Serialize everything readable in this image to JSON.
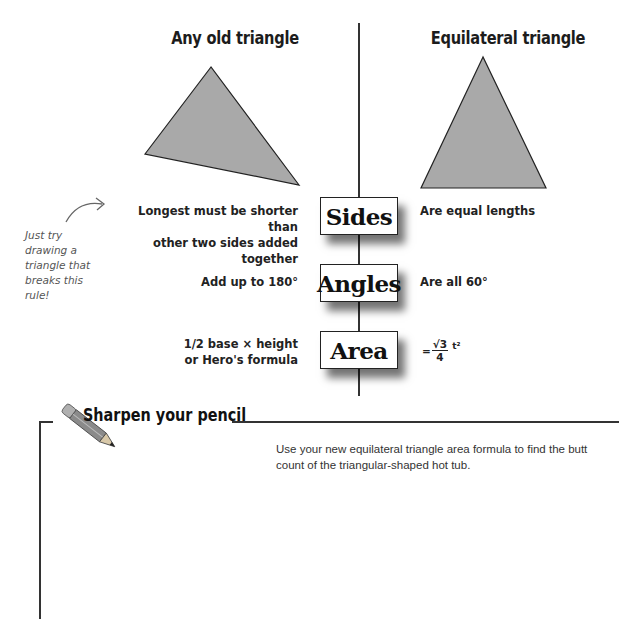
{
  "columns": {
    "left_title": "Any old triangle",
    "right_title": "Equilateral triangle"
  },
  "rows": [
    {
      "label": "Sides",
      "left": [
        "Longest must be shorter than",
        "other two sides added together"
      ],
      "right": "Are equal lengths"
    },
    {
      "label": "Angles",
      "left": [
        "Add up to 180°"
      ],
      "right": "Are all 60°"
    },
    {
      "label": "Area",
      "left": [
        "1/2 base × height",
        "or Hero's formula"
      ],
      "right": {
        "prefix": "=",
        "numerator": "√3",
        "denominator": "4",
        "suffix": "t²"
      }
    }
  ],
  "annotation": {
    "lines": [
      "Just try",
      "drawing a",
      "triangle that",
      "breaks this",
      "rule!"
    ]
  },
  "sharpen": {
    "title": "Sharpen your pencil",
    "icon": "pencil-icon",
    "instructions": [
      "Use your new equilateral triangle area formula to find the butt",
      "count of the triangular-shaped hot tub."
    ]
  },
  "colors": {
    "triangle_fill": "#a9a9a9",
    "triangle_stroke": "#222222",
    "line": "#333333"
  }
}
